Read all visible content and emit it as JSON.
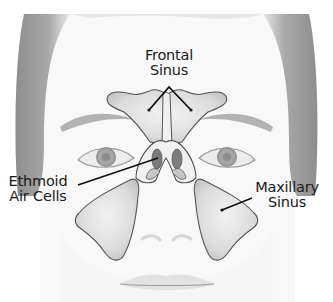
{
  "figure": {
    "colors": {
      "background": "#ffffff",
      "skin": "#f7f7f7",
      "hair": "#9a9a9a",
      "brow": "#b5b5b5",
      "sinus_fill": "#d9d9d9",
      "sinus_stroke": "#555555",
      "ethmoid_dark": "#7a7a7a",
      "leader_line": "#111111"
    }
  },
  "labels": {
    "frontal": {
      "line1": "Frontal",
      "line2": "Sinus"
    },
    "ethmoid": {
      "line1": "Ethmoid",
      "line2": "Air Cells"
    },
    "maxillary": {
      "line1": "Maxillary",
      "line2": "Sinus"
    }
  }
}
